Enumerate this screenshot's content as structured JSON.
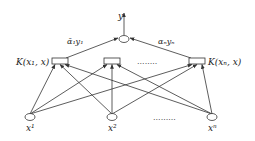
{
  "diagram": {
    "type": "network",
    "title": "",
    "output": {
      "label": "y"
    },
    "weights": {
      "left": "ᾱ₁y₁",
      "right": "αₙyₙ"
    },
    "kernels": [
      {
        "label": "K(x₁, x)"
      },
      {
        "label": ""
      },
      {
        "label": "K(xₙ, x)"
      }
    ],
    "kernel_ellipsis": "........",
    "inputs": [
      {
        "label": "x¹"
      },
      {
        "label": "x²"
      },
      {
        "label": "xⁿ"
      }
    ],
    "input_ellipsis": ".........",
    "colors": {
      "stroke": "#333333",
      "text": "#222222",
      "background": "#ffffff"
    }
  }
}
